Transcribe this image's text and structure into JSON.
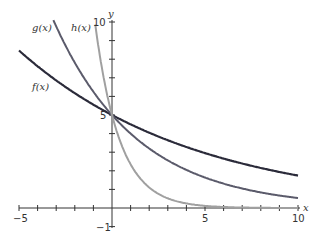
{
  "chart_data": {
    "type": "line",
    "title": "",
    "xlabel": "x",
    "ylabel": "y",
    "xlim": [
      -5,
      10
    ],
    "ylim": [
      -1,
      10
    ],
    "x_ticks_labeled": [
      "-5",
      "5",
      "10"
    ],
    "y_ticks_labeled": [
      "10",
      "5",
      "-1"
    ],
    "grid": false,
    "series": [
      {
        "name": "f(x)",
        "formula": "5*0.9^x",
        "color": "#2b2b3a",
        "x": [
          -5,
          0,
          5,
          10
        ],
        "values": [
          8.47,
          5,
          2.95,
          1.74
        ]
      },
      {
        "name": "g(x)",
        "formula": "5*0.8^x",
        "color": "#5b5b6b",
        "x": [
          -3.1,
          0,
          5,
          10
        ],
        "values": [
          10,
          5,
          1.64,
          0.54
        ]
      },
      {
        "name": "h(x)",
        "formula": "5*0.5^x",
        "color": "#9a9a9a",
        "x": [
          -1,
          0,
          2,
          5,
          10
        ],
        "values": [
          10,
          5,
          1.25,
          0.16,
          0.005
        ]
      }
    ]
  },
  "labels": {
    "f": "f(x)",
    "g": "g(x)",
    "h": "h(x)",
    "x": "x",
    "y": "y",
    "xm5": "−5",
    "x5": "5",
    "x10": "10",
    "y10": "10",
    "y5": "5",
    "ym1": "−1"
  }
}
